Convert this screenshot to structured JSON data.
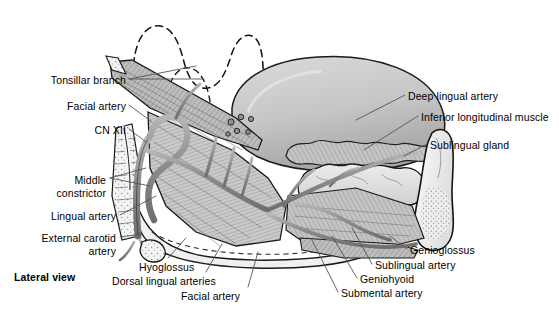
{
  "figure": {
    "view_label": "Lateral view",
    "title_colors": {
      "ink": "#000000",
      "paper": "#ffffff",
      "tongue_fill": "#c9c9c9",
      "tongue_shade": "#a8a8a8",
      "muscle_fill": "#b4b4b4",
      "gland_fill": "#dcdcdc",
      "bone_fill": "#f2f2f2",
      "vessel_fill": "#9a9a9a",
      "leader_line": "#666666",
      "dashed_line": "#111111"
    },
    "labels_left": [
      {
        "id": "tonsillar-branch",
        "text": "Tonsillar branch",
        "x": 30,
        "y": 74,
        "align": "right",
        "width": 96
      },
      {
        "id": "facial-artery-upper",
        "text": "Facial artery",
        "x": 50,
        "y": 100,
        "align": "right",
        "width": 76
      },
      {
        "id": "cn-xii",
        "text": "CN XII",
        "x": 68,
        "y": 124,
        "align": "right",
        "width": 58
      },
      {
        "id": "middle-constrictor",
        "text": "Middle\nconstrictor",
        "x": 44,
        "y": 174,
        "align": "right",
        "width": 62
      },
      {
        "id": "lingual-artery",
        "text": "Lingual artery",
        "x": 38,
        "y": 210,
        "align": "right",
        "width": 78
      },
      {
        "id": "external-carotid-artery",
        "text": "External carotid\nartery",
        "x": 28,
        "y": 232,
        "align": "right",
        "width": 88
      }
    ],
    "labels_bottom": [
      {
        "id": "hyoglossus",
        "text": "Hyoglossus",
        "x": 139,
        "y": 261,
        "align": "left",
        "width": 70
      },
      {
        "id": "dorsal-lingual-arteries",
        "text": "Dorsal lingual arteries",
        "x": 112,
        "y": 275,
        "align": "left",
        "width": 122
      },
      {
        "id": "facial-artery-lower",
        "text": "Facial artery",
        "x": 181,
        "y": 290,
        "align": "left",
        "width": 76
      }
    ],
    "labels_right": [
      {
        "id": "deep-lingual-artery",
        "text": "Deep lingual artery",
        "x": 408,
        "y": 90,
        "align": "left",
        "width": 112
      },
      {
        "id": "inferior-longitudinal-muscle",
        "text": "Inferior longitudinal muscle",
        "x": 421,
        "y": 111,
        "align": "left",
        "width": 152
      },
      {
        "id": "sublingual-gland",
        "text": "Sublingual gland",
        "x": 430,
        "y": 139,
        "align": "left",
        "width": 100
      }
    ],
    "labels_bottom_right": [
      {
        "id": "genioglossus",
        "text": "Genioglossus",
        "x": 410,
        "y": 244,
        "align": "left",
        "width": 82
      },
      {
        "id": "sublingual-artery",
        "text": "Sublingual artery",
        "x": 375,
        "y": 259,
        "align": "left",
        "width": 100
      },
      {
        "id": "geniohyoid",
        "text": "Geniohyoid",
        "x": 360,
        "y": 273,
        "align": "left",
        "width": 72
      },
      {
        "id": "submental-artery",
        "text": "Submental artery",
        "x": 341,
        "y": 287,
        "align": "left",
        "width": 104
      }
    ]
  }
}
